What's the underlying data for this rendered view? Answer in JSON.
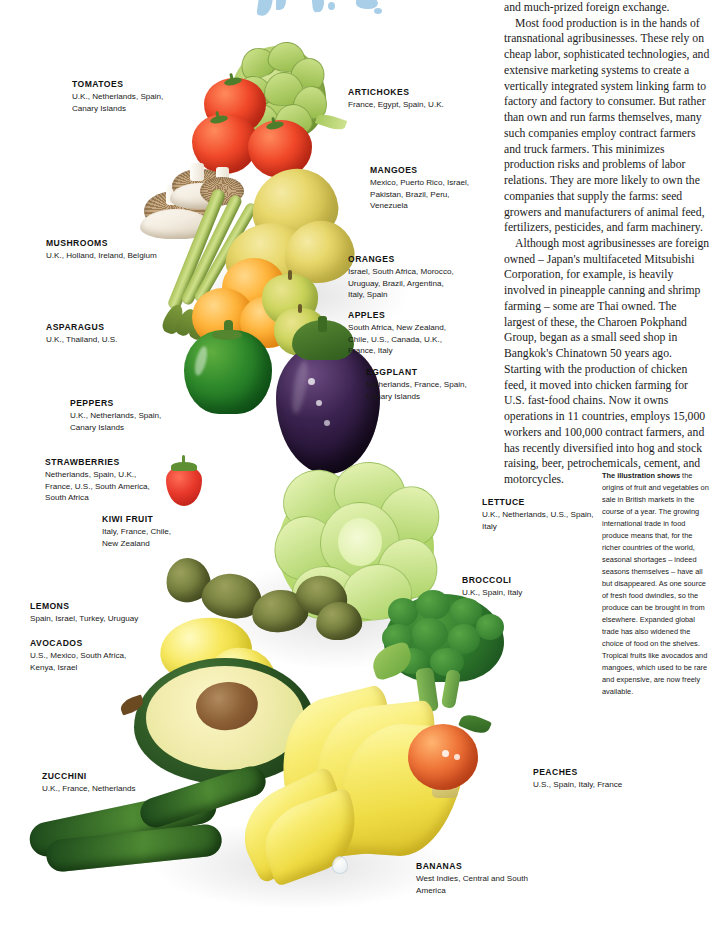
{
  "document": {
    "title": "Fruit and Vegetables — Origins of Produce on Sale in British Markets"
  },
  "body_text": {
    "paragraphs": [
      "and much-prized foreign exchange.",
      "Most food production is in the hands of transnational agribusinesses. These rely on cheap labor, sophisticated technologies, and extensive marketing systems to create a vertically integrated system linking farm to factory and factory to consumer. But rather than own and run farms themselves, many such companies employ contract farmers and truck farmers. This minimizes production risks and problems of labor relations. They are more likely to own the companies that supply the farms: seed growers and manufacturers of animal feed, fertilizers, pesticides, and farm machinery.",
      "Although most agribusinesses are foreign owned – Japan's multifaceted Mitsubishi Corporation, for example, is heavily involved in pineapple canning and shrimp farming – some are Thai owned. The largest of these, the Charoen Pokphand Group, began as a small seed shop in Bangkok's Chinatown 50 years ago. Starting with the production of chicken feed, it moved into chicken farming for U.S. fast-food chains. Now it owns operations in 11 countries, employs 15,000 workers and 100,000 contract farmers, and has recently diversified into hog and stock raising, beer, petrochemicals, cement, and motorcycles."
    ]
  },
  "caption": {
    "lead": "The illustration shows",
    "text": " the origins of fruit and vegetables on sale in British markets in the course of a year. The growing international trade in food produce means that, for the richer countries of the world, seasonal shortages – indeed seasons themselves – have all but disappeared. As one source of fresh food dwindles, so the produce can be brought in from elsewhere. Expanded global trade has also widened the choice of food on the shelves. Tropical fruits like avocados and mangoes, which used to be rare and expensive, are now freely available."
  },
  "labels": {
    "tomatoes": {
      "name": "TOMATOES",
      "sources": "U.K., Netherlands, Spain,\nCanary Islands"
    },
    "artichokes": {
      "name": "ARTICHOKES",
      "sources": "France, Egypt, Spain, U.K."
    },
    "mangoes": {
      "name": "MANGOES",
      "sources": "Mexico, Puerto Rico, Israel,\nPakistan, Brazil, Peru,\nVenezuela"
    },
    "mushrooms": {
      "name": "MUSHROOMS",
      "sources": "U.K., Holland, Ireland, Belgium"
    },
    "oranges": {
      "name": "ORANGES",
      "sources": "Israel, South Africa, Morocco,\nUruguay, Brazil, Argentina,\nItaly, Spain"
    },
    "asparagus": {
      "name": "ASPARAGUS",
      "sources": "U.K., Thailand, U.S."
    },
    "apples": {
      "name": "APPLES",
      "sources": "South Africa, New Zealand,\nChile, U.S., Canada, U.K.,\nFrance, Italy"
    },
    "eggplant": {
      "name": "EGGPLANT",
      "sources": "Netherlands, France, Spain,\nCanary Islands"
    },
    "peppers": {
      "name": "PEPPERS",
      "sources": "U.K., Netherlands, Spain,\nCanary Islands"
    },
    "strawberries": {
      "name": "STRAWBERRIES",
      "sources": "Netherlands, Spain, U.K.,\nFrance, U.S., South America,\nSouth Africa"
    },
    "kiwi_fruit": {
      "name": "KIWI FRUIT",
      "sources": "Italy, France, Chile,\nNew Zealand"
    },
    "lettuce": {
      "name": "LETTUCE",
      "sources": "U.K., Netherlands, U.S., Spain,\nItaly"
    },
    "broccoli": {
      "name": "BROCCOLI",
      "sources": "U.K., Spain, Italy"
    },
    "lemons": {
      "name": "LEMONS",
      "sources": "Spain, Israel, Turkey, Uruguay"
    },
    "avocados": {
      "name": "AVOCADOS",
      "sources": "U.S., Mexico, South Africa,\nKenya, Israel"
    },
    "zucchini": {
      "name": "ZUCCHINI",
      "sources": "U.K., France, Netherlands"
    },
    "peaches": {
      "name": "PEACHES",
      "sources": "U.S., Spain, Italy, France"
    },
    "bananas": {
      "name": "BANANAS",
      "sources": "West Indies, Central and South\nAmerica"
    }
  },
  "colors": {
    "page_background": "#ffffff",
    "text": "#1a1a1a",
    "map_blue": "#a9cfe8",
    "tomato_red": "#e8392b",
    "orange": "#ffb53c",
    "lettuce_green": "#b6d96e",
    "eggplant_purple": "#3b2350",
    "banana_yellow": "#f6e45c"
  }
}
